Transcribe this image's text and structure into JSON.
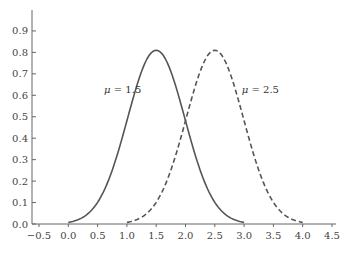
{
  "chart_data": {
    "type": "line",
    "title": "",
    "xlabel": "",
    "ylabel": "",
    "xlim": [
      -0.5,
      4.5
    ],
    "ylim": [
      0.0,
      1.0
    ],
    "x_ticks": [
      "-0.5",
      "0.0",
      "0.5",
      "1.0",
      "1.5",
      "2.0",
      "2.5",
      "3.0",
      "3.5",
      "4.0",
      "4.5"
    ],
    "y_ticks": [
      "0.0",
      "0.1",
      "0.2",
      "0.3",
      "0.4",
      "0.5",
      "0.6",
      "0.7",
      "0.8",
      "0.9"
    ],
    "grid": false,
    "legend": "inline annotations",
    "series": [
      {
        "name": "μ = 1.5",
        "mu": 1.5,
        "sigma": 0.49,
        "x_range": [
          0.0,
          3.0
        ],
        "peak": 0.81,
        "style": "solid",
        "x": [
          0.0,
          0.5,
          1.0,
          1.5,
          2.0,
          2.5,
          3.0
        ],
        "values": [
          0.01,
          0.11,
          0.48,
          0.81,
          0.48,
          0.11,
          0.01
        ]
      },
      {
        "name": "μ = 2.5",
        "mu": 2.5,
        "sigma": 0.49,
        "x_range": [
          1.0,
          4.0
        ],
        "peak": 0.81,
        "style": "dashed",
        "x": [
          1.0,
          1.5,
          2.0,
          2.5,
          3.0,
          3.5,
          4.0
        ],
        "values": [
          0.01,
          0.11,
          0.48,
          0.81,
          0.48,
          0.11,
          0.01
        ]
      }
    ],
    "annotations": [
      {
        "text": "μ = 1.5",
        "x": 0.85,
        "y": 0.63
      },
      {
        "text": "μ = 2.5",
        "x": 3.2,
        "y": 0.63
      }
    ]
  }
}
